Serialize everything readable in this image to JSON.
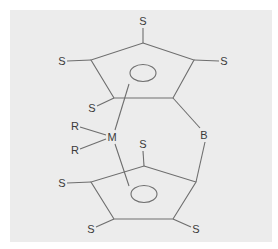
{
  "diagram": {
    "background": "#ececec",
    "line_color": "#6e6e6e",
    "text_color": "#3a3a3a",
    "top_ring": {
      "substituents": [
        {
          "label": "S",
          "x": 143,
          "y": 21
        },
        {
          "label": "S",
          "x": 62,
          "y": 61
        },
        {
          "label": "S",
          "x": 224,
          "y": 61
        },
        {
          "label": "S",
          "x": 92,
          "y": 108
        }
      ]
    },
    "bottom_ring": {
      "substituents": [
        {
          "label": "S",
          "x": 143,
          "y": 144
        },
        {
          "label": "S",
          "x": 62,
          "y": 183
        },
        {
          "label": "S",
          "x": 91,
          "y": 229
        },
        {
          "label": "S",
          "x": 196,
          "y": 229
        }
      ]
    },
    "metal": {
      "label": "M",
      "x": 112,
      "y": 137
    },
    "ligands": [
      {
        "label": "R",
        "x": 75,
        "y": 126
      },
      {
        "label": "R",
        "x": 75,
        "y": 150
      }
    ],
    "bridge": {
      "label": "B",
      "x": 204,
      "y": 135
    }
  }
}
